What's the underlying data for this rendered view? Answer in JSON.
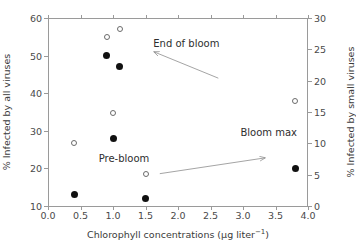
{
  "chart_data": {
    "type": "scatter",
    "title": "",
    "xlabel": "Chlorophyll concentrations (μg liter⁻¹)",
    "ylabel": "% Infected by all viruses",
    "y2label": "% Infected by small viruses",
    "xlim": [
      0.0,
      4.0
    ],
    "ylim": [
      10,
      60
    ],
    "y2lim": [
      0,
      30
    ],
    "grid": false,
    "legend": "none",
    "xticks": [
      "0.0",
      "0.5",
      "1.0",
      "1.5",
      "2.0",
      "2.5",
      "3.0",
      "3.5",
      "4.0"
    ],
    "xtick_values": [
      0.0,
      0.5,
      1.0,
      1.5,
      2.0,
      2.5,
      3.0,
      3.5,
      4.0
    ],
    "yticks": [
      "10",
      "20",
      "30",
      "40",
      "50",
      "60"
    ],
    "ytick_values": [
      10,
      20,
      30,
      40,
      50,
      60
    ],
    "y2ticks": [
      "0",
      "5",
      "10",
      "15",
      "20",
      "25",
      "30"
    ],
    "y2tick_values": [
      0,
      5,
      10,
      15,
      20,
      25,
      30
    ],
    "series": [
      {
        "name": "% Infected by all viruses",
        "marker": "filled-circle",
        "color": "#111111",
        "axis": "left",
        "points": [
          {
            "x": 0.4,
            "y": 13
          },
          {
            "x": 0.9,
            "y": 50
          },
          {
            "x": 1.0,
            "y": 28
          },
          {
            "x": 1.1,
            "y": 47
          },
          {
            "x": 1.5,
            "y": 12
          },
          {
            "x": 3.8,
            "y": 20
          }
        ]
      },
      {
        "name": "% Infected by small viruses",
        "marker": "open-circle",
        "color": "#6b6b6b",
        "axis": "right",
        "points": [
          {
            "x": 0.4,
            "y": 10.0
          },
          {
            "x": 0.9,
            "y": 27.0
          },
          {
            "x": 1.0,
            "y": 14.9
          },
          {
            "x": 1.1,
            "y": 28.2
          },
          {
            "x": 1.5,
            "y": 5.1
          },
          {
            "x": 3.8,
            "y": 16.8
          }
        ]
      }
    ],
    "annotations": [
      {
        "name": "end-of-bloom",
        "text": "End of bloom",
        "x": 1.62,
        "y": 53.0,
        "arrow": {
          "from_x": 2.62,
          "from_y": 44.0,
          "to_x": 1.63,
          "to_y": 51.0
        }
      },
      {
        "name": "pre-bloom",
        "text": "Pre-bloom",
        "x": 0.78,
        "y": 22.5,
        "arrow": {
          "from_x": 1.72,
          "from_y": 18.6,
          "to_x": 3.34,
          "to_y": 22.8
        }
      },
      {
        "name": "bloom-max",
        "text": "Bloom max",
        "x": 2.96,
        "y": 29.5
      }
    ]
  }
}
